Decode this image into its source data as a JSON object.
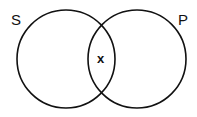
{
  "diagram": {
    "type": "venn",
    "sets": [
      {
        "label": "S",
        "cx": 66,
        "cy": 59,
        "r": 49
      },
      {
        "label": "P",
        "cx": 137,
        "cy": 59,
        "r": 49
      }
    ],
    "intersection_label": "x",
    "stroke_color": "#111111",
    "background": "#ffffff"
  }
}
